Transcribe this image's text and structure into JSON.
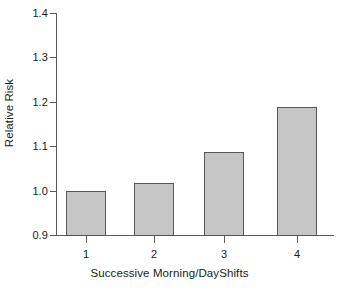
{
  "chart_data": {
    "type": "bar",
    "title": "",
    "xlabel": "Successive Morning/DayShifts",
    "ylabel": "Relative Risk",
    "categories": [
      "1",
      "2",
      "3",
      "4"
    ],
    "values": [
      1.0,
      1.02,
      1.09,
      1.19
    ],
    "ylim": [
      0.9,
      1.4
    ],
    "ytick_labels": [
      "0.9",
      "1.0",
      "1.1",
      "1.2",
      "1.3",
      "1.4"
    ],
    "ytick_values": [
      0.9,
      1.0,
      1.1,
      1.2,
      1.3,
      1.4
    ],
    "xtick_labels": [
      "1",
      "2",
      "3",
      "4"
    ],
    "grid": false,
    "legend": null,
    "bar_fill_color": "#c6c6c6",
    "bar_edge_color": "#575757",
    "axis_color": "#5b5b5b",
    "background_color": "#ffffff"
  },
  "bars": [
    {
      "category": "1",
      "value": "1.00",
      "left": 66,
      "width": 40,
      "top": 191
    },
    {
      "category": "2",
      "value": "1.02",
      "left": 134,
      "width": 40,
      "top": 183
    },
    {
      "category": "3",
      "value": "1.09",
      "left": 204,
      "width": 40,
      "top": 152
    },
    {
      "category": "4",
      "value": "1.19",
      "left": 277,
      "width": 40,
      "top": 107
    }
  ],
  "yticks": [
    {
      "label": "1.4",
      "y": 13
    },
    {
      "label": "1.3",
      "y": 57
    },
    {
      "label": "1.2",
      "y": 102
    },
    {
      "label": "1.1",
      "y": 146
    },
    {
      "label": "1.0",
      "y": 191
    },
    {
      "label": "0.9",
      "y": 235
    }
  ],
  "xticks": [
    {
      "label": "1",
      "x": 86
    },
    {
      "label": "2",
      "x": 154
    },
    {
      "label": "3",
      "x": 224
    },
    {
      "label": "4",
      "x": 297
    }
  ]
}
